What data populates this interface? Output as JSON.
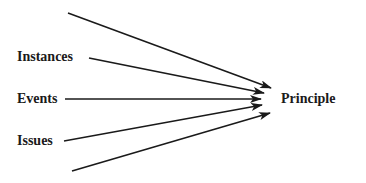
{
  "diagram": {
    "inputs": [
      {
        "label": "",
        "from": [
          68,
          13
        ],
        "to": [
          271,
          88
        ]
      },
      {
        "label": "Instances",
        "from": [
          89,
          58
        ],
        "to": [
          264,
          93
        ]
      },
      {
        "label": "Events",
        "from": [
          65,
          99
        ],
        "to": [
          261,
          99
        ]
      },
      {
        "label": "Issues",
        "from": [
          64,
          141
        ],
        "to": [
          262,
          105
        ]
      },
      {
        "label": "",
        "from": [
          72,
          171
        ],
        "to": [
          270,
          113
        ]
      }
    ],
    "target": {
      "label": "Principle"
    },
    "colors": {
      "line": "#1a1a1a",
      "text": "#1a1a1a"
    }
  }
}
